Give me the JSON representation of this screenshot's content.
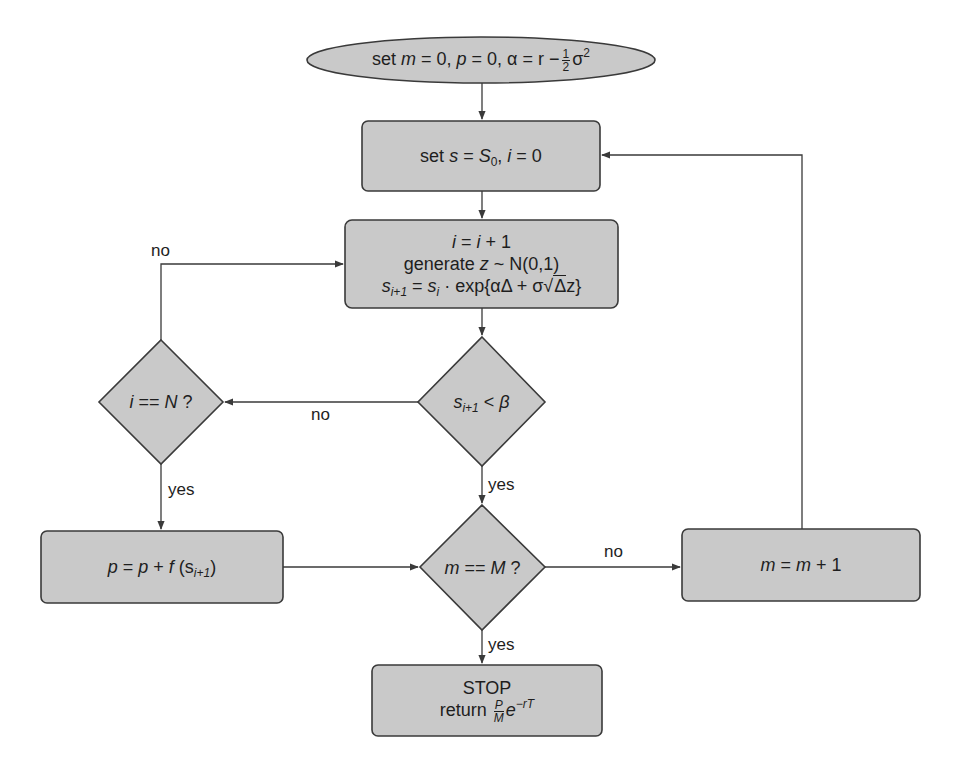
{
  "diagram": {
    "type": "flowchart",
    "colors": {
      "node_fill": "#c9c9c9",
      "stroke": "#3a3a3a",
      "background": "#ffffff"
    },
    "nodes": {
      "init": {
        "shape": "ellipse",
        "prefix": "set ",
        "m_var": "m",
        "eq_zero_1": " = 0, ",
        "p_var": "p",
        "eq_zero_2": " = 0, ",
        "alpha_expr": "α = r −",
        "frac_num": "1",
        "frac_den": "2",
        "sigma": "σ",
        "sigma_exp": "2",
        "full_text": "set m = 0, p = 0, α = r − ½σ²"
      },
      "reset_path": {
        "shape": "rounded-rect",
        "prefix": "set ",
        "s_var": "s",
        "eq": " = ",
        "S0_var": "S",
        "S0_sub": "0",
        "comma": ", ",
        "i_var": "i",
        "eq_zero": " = 0",
        "full_text": "set s = S0, i = 0"
      },
      "step": {
        "shape": "rounded-rect",
        "line1": {
          "i": "i",
          "eq": " = ",
          "i2": "i",
          "plus": " + 1"
        },
        "line2": {
          "text": "generate ",
          "z": "z",
          "dist": " ~ N(0,1)"
        },
        "line3": {
          "s": "s",
          "sub_next": "i+1",
          "eq": " = ",
          "s2": "s",
          "sub_i": "i",
          "mid": " · exp{αΔ + σ",
          "sqrt": "Δ",
          "end": "z}"
        },
        "full_text": "i = i + 1; generate z ~ N(0,1); s_{i+1} = s_i · exp{αΔ + σ√Δ z}"
      },
      "barrier_check": {
        "shape": "diamond",
        "s": "s",
        "sub": "i+1",
        "op": " < ",
        "beta": "β",
        "full_text": "s_{i+1} < β"
      },
      "maturity_check": {
        "shape": "diamond",
        "i": "i",
        "op": " == ",
        "N": "N",
        "q": " ?",
        "full_text": "i == N ?"
      },
      "payoff": {
        "shape": "rounded-rect",
        "p": "p",
        "eq": " = ",
        "p2": "p",
        "plus": " + ",
        "f": "f",
        "open": " (s",
        "sub": "i+1",
        "close": ")",
        "full_text": "p = p + f(s_{i+1})"
      },
      "sim_check": {
        "shape": "diamond",
        "m": "m",
        "op": " == ",
        "M": "M",
        "q": " ?",
        "full_text": "m == M ?"
      },
      "increment": {
        "shape": "rounded-rect",
        "m": "m",
        "eq": " = ",
        "m2": "m",
        "plus": " + 1",
        "full_text": "m = m + 1"
      },
      "stop": {
        "shape": "rounded-rect",
        "line1": "STOP",
        "return_word": "return ",
        "frac_num": "P",
        "frac_den": "M",
        "e": "e",
        "exp": "−rT",
        "full_text": "STOP return (P/M) e^{−rT}"
      }
    },
    "edge_labels": {
      "loop_no": "no",
      "barrier_no": "no",
      "maturity_yes": "yes",
      "barrier_yes": "yes",
      "sim_no": "no",
      "sim_yes": "yes"
    }
  }
}
